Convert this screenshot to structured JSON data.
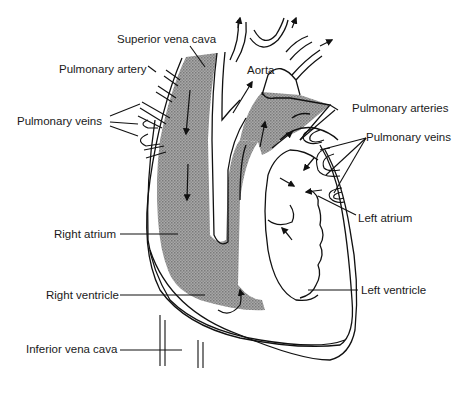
{
  "diagram": {
    "colors": {
      "deoxygenated_fill": "#9a9a9a",
      "outline": "#111111",
      "background": "#ffffff"
    },
    "labels": {
      "superior_vena_cava": "Superior vena cava",
      "pulmonary_artery": "Pulmonary artery",
      "pulmonary_veins_left": "Pulmonary veins",
      "aorta": "Aorta",
      "pulmonary_arteries": "Pulmonary arteries",
      "pulmonary_veins_right": "Pulmonary veins",
      "left_atrium": "Left atrium",
      "right_atrium": "Right atrium",
      "right_ventricle": "Right ventricle",
      "left_ventricle": "Left ventricle",
      "inferior_vena_cava": "Inferior vena cava"
    }
  }
}
